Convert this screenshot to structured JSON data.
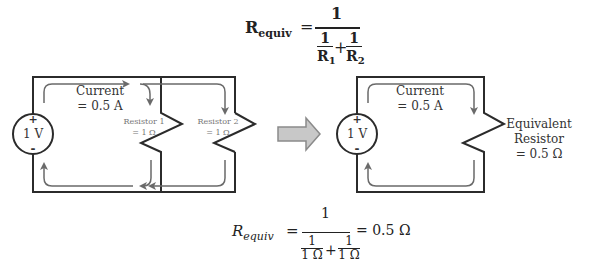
{
  "top_formula": {
    "lhs": "R",
    "lhs_sub": "equiv",
    "equals": "=",
    "numerator": "1",
    "terms": [
      {
        "num": "1",
        "den": "R",
        "den_sub": "1"
      },
      {
        "num": "1",
        "den": "R",
        "den_sub": "2"
      }
    ],
    "plus": "+"
  },
  "left_circuit": {
    "source_label": "1 V",
    "plus_sign": "+",
    "minus_sign": "-",
    "current_label_1": "Current",
    "current_label_2": "= 0.5 A",
    "resistor1_label_1": "Resistor 1",
    "resistor1_label_2": "= 1 Ω",
    "resistor2_label_1": "Resistor 2",
    "resistor2_label_2": "= 1 Ω"
  },
  "transform_arrow": "right-arrow",
  "right_circuit": {
    "source_label": "1 V",
    "plus_sign": "+",
    "minus_sign": "-",
    "current_label_1": "Current",
    "current_label_2": "= 0.5 A",
    "equiv_label_1": "Equivalent",
    "equiv_label_2": "Resistor",
    "equiv_label_3": "= 0.5 Ω"
  },
  "bottom_formula": {
    "lhs": "R",
    "lhs_sub": "equiv",
    "equals": "=",
    "numerator": "1",
    "terms": [
      {
        "num": "1",
        "den": "1 Ω"
      },
      {
        "num": "1",
        "den": "1 Ω"
      }
    ],
    "plus": "+",
    "result": "= 0.5 Ω"
  },
  "colors": {
    "wire": "#2b2b2b",
    "current_arrow": "#6a6a6a",
    "arrow_fill": "#c8c8c8",
    "arrow_stroke": "#8a8a8a"
  }
}
